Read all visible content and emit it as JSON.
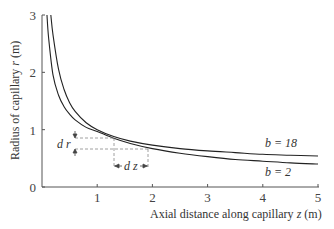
{
  "chart_data": {
    "type": "line",
    "title": "",
    "xlabel": "Axial distance along capillary z (m)",
    "ylabel": "Radius of capillary r (m)",
    "xlim": [
      0,
      5
    ],
    "ylim": [
      0,
      3
    ],
    "x_ticks": [
      "1",
      "2",
      "3",
      "4",
      "5"
    ],
    "y_ticks": [
      "0",
      "1",
      "2",
      "3"
    ],
    "grid": false,
    "legend_position": "inline labels near right end of curves",
    "series": [
      {
        "name": "b = 18",
        "x": [
          0.16,
          0.2,
          0.3,
          0.4,
          0.5,
          0.6,
          0.8,
          1.0,
          1.3,
          1.6,
          2.0,
          2.5,
          3.0,
          3.5,
          4.0,
          4.5,
          5.0
        ],
        "y": [
          3.0,
          2.65,
          2.05,
          1.7,
          1.47,
          1.32,
          1.12,
          1.0,
          0.88,
          0.8,
          0.73,
          0.67,
          0.63,
          0.6,
          0.57,
          0.555,
          0.54
        ]
      },
      {
        "name": "b = 2",
        "x": [
          0.09,
          0.12,
          0.2,
          0.3,
          0.4,
          0.5,
          0.6,
          0.8,
          1.0,
          1.3,
          1.6,
          2.0,
          2.5,
          3.0,
          3.5,
          4.0,
          4.5,
          5.0
        ],
        "y": [
          3.0,
          2.6,
          1.95,
          1.6,
          1.4,
          1.27,
          1.17,
          1.04,
          0.97,
          0.85,
          0.76,
          0.67,
          0.59,
          0.53,
          0.48,
          0.45,
          0.42,
          0.4
        ]
      }
    ],
    "annotations": [
      {
        "text": "b = 18",
        "x": 4.3,
        "y": 0.7
      },
      {
        "text": "b = 2",
        "x": 4.3,
        "y": 0.25
      },
      {
        "text": "dr",
        "type": "vertical-dimension",
        "x": 0.6,
        "y_range": [
          0.67,
          0.86
        ]
      },
      {
        "text": "dz",
        "type": "horizontal-dimension",
        "y": 0.35,
        "x_range": [
          1.3,
          1.9
        ]
      }
    ]
  },
  "labels": {
    "xlabel_text": "Axial distance along capillary ",
    "xlabel_var": "z",
    "xlabel_unit": " (m)",
    "ylabel_text": "Radius of capillary ",
    "ylabel_var": "r",
    "ylabel_unit": " (m)",
    "b18": "b = 18",
    "b2": "b = 2",
    "dr": "d r",
    "dz": "d z"
  }
}
